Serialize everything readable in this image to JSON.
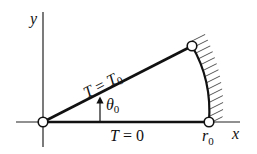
{
  "diagram": {
    "axes": {
      "x_label": "x",
      "y_label": "y"
    },
    "edges": {
      "upper": {
        "label_T": "T",
        "label_eq": " = ",
        "label_val": "T",
        "label_sub": "0"
      },
      "lower": {
        "label_T": "T",
        "label_eq": " = ",
        "label_val": "0"
      }
    },
    "angle": {
      "symbol": "θ",
      "sub": "0"
    },
    "radius": {
      "symbol": "r",
      "sub": "0"
    },
    "colors": {
      "stroke": "#111111",
      "hatch": "#555555",
      "background": "#ffffff"
    }
  }
}
